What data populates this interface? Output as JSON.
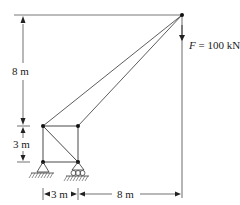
{
  "diagram": {
    "type": "truss-crane",
    "load": {
      "symbol": "F",
      "equals": " = ",
      "value": "100 kN"
    },
    "dimensions": {
      "vertical_upper": "8 m",
      "vertical_lower": "3 m",
      "horizontal_left": "3 m",
      "horizontal_right": "8 m"
    },
    "nodes": [
      {
        "id": "apex",
        "x": 182,
        "y": 15
      },
      {
        "id": "top-left",
        "x": 43,
        "y": 126
      },
      {
        "id": "top-right",
        "x": 78,
        "y": 126
      },
      {
        "id": "bottom-left",
        "x": 43,
        "y": 162
      },
      {
        "id": "bottom-right",
        "x": 78,
        "y": 162
      }
    ],
    "supports": [
      {
        "node": "bottom-left",
        "kind": "pin"
      },
      {
        "node": "bottom-right",
        "kind": "roller"
      }
    ],
    "colors": {
      "line": "#333333",
      "node": "#111111"
    }
  }
}
